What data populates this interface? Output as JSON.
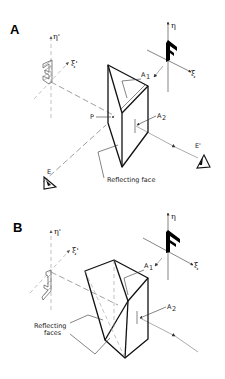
{
  "panels": [
    {
      "id": "A",
      "label": "A",
      "object_label": "F",
      "axes": {
        "eta": "η",
        "xi": "ξ",
        "eta_prime": "η'",
        "xi_prime": "ξ'"
      },
      "annotations": {
        "a1": "A",
        "a1_sub": "1",
        "a2": "A",
        "a2_sub": "2",
        "point_p": "P",
        "eye_e": "E",
        "eye_e_prime": "E'"
      },
      "callout": "Reflecting face"
    },
    {
      "id": "B",
      "label": "B",
      "object_label": "F",
      "axes": {
        "eta": "η",
        "xi": "ξ",
        "eta_prime": "η'",
        "xi_prime": "ξ'"
      },
      "annotations": {
        "a1": "A",
        "a1_sub": "1",
        "a2": "A",
        "a2_sub": "2"
      },
      "callout_line1": "Reflecting",
      "callout_line2": "faces"
    }
  ]
}
